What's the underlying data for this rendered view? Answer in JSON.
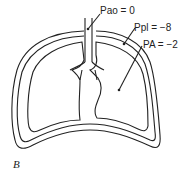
{
  "labels": {
    "pao": "Pao = 0",
    "ppl": "Ppl = −8",
    "pa": "PA = −2"
  },
  "figure_label": "B",
  "colors": {
    "stroke": "#222222",
    "background": "#ffffff"
  }
}
